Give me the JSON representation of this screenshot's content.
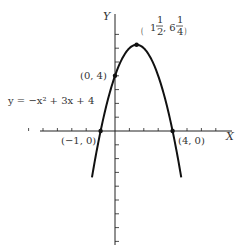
{
  "chart_data": {
    "type": "line",
    "title": "",
    "function": "y = -x^2 + 3x + 4",
    "xlabel": "X",
    "ylabel": "Y",
    "xlim": [
      -7,
      8
    ],
    "ylim": [
      -9,
      8
    ],
    "x_ticks": [
      -6,
      -5,
      -4,
      -3,
      -2,
      -1,
      1,
      2,
      3,
      4,
      5,
      6,
      7
    ],
    "y_ticks": [
      -8,
      -7,
      -6,
      -5,
      -4,
      -3,
      -2,
      -1,
      1,
      2,
      3,
      4,
      5,
      6,
      7
    ],
    "curve_x_range": [
      -1.6,
      4.6
    ],
    "grid": false,
    "series": [
      {
        "name": "y = -x^2 + 3x + 4",
        "coefficients": {
          "a": -1,
          "b": 3,
          "c": 4
        }
      }
    ],
    "points": [
      {
        "x": 1.5,
        "y": 6.25,
        "label_main": "1",
        "label_frac1": "1",
        "label_frac1_den": "2",
        "label_mid": ", 6",
        "label_frac2": "1",
        "label_frac2_den": "4",
        "name": "vertex"
      },
      {
        "x": 0,
        "y": 4,
        "label": "(0, 4)",
        "name": "y-intercept"
      },
      {
        "x": -1,
        "y": 0,
        "label": "(−1, 0)",
        "name": "x-intercept-left"
      },
      {
        "x": 4,
        "y": 0,
        "label": "(4, 0)",
        "name": "x-intercept-right"
      }
    ],
    "annotations": [
      {
        "text": "y = −x² + 3x + 4",
        "name": "equation-label"
      }
    ]
  }
}
